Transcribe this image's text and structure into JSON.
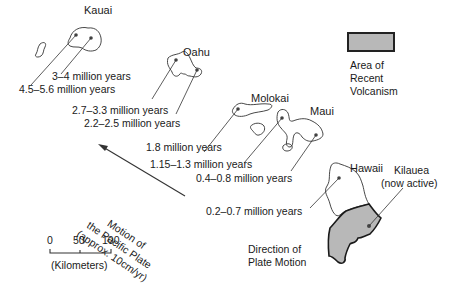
{
  "islands": [
    {
      "name": "Kauai",
      "ages": [
        "3–4 million years",
        "4.5–5.6 million years"
      ]
    },
    {
      "name": "Oahu",
      "ages": [
        "2.7–3.3 million years",
        "2.2–2.5 million years"
      ]
    },
    {
      "name": "Molokai",
      "ages": [
        "1.8 million years"
      ]
    },
    {
      "name": "Maui",
      "ages": [
        "1.15–1.3 million years",
        "0.4–0.8 million years"
      ]
    },
    {
      "name": "Hawaii",
      "ages": [
        "0.2–0.7 million years"
      ]
    }
  ],
  "kilauea": {
    "line1": "Kilauea",
    "line2": "(now active)"
  },
  "legend": {
    "fill_color": "#b8b8b8",
    "lines": [
      "Area of",
      "Recent",
      "Volcanism"
    ]
  },
  "motion_arrow": {
    "lines": [
      "Motion of",
      "the Pacific Plate",
      "(approx. 10cm/yr)"
    ]
  },
  "scale": {
    "ticks": [
      "0",
      "50",
      "100"
    ],
    "unit": "(Kilometers)"
  },
  "direction_label": {
    "lines": [
      "Direction of",
      "Plate Motion"
    ]
  }
}
